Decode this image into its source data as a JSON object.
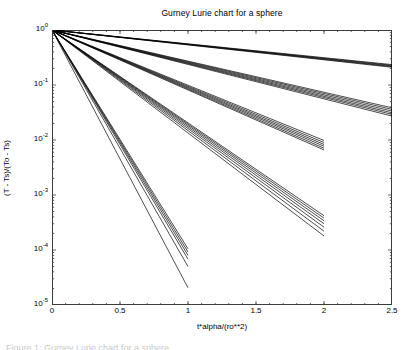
{
  "figure": {
    "title": "Gurney Lurie chart for a sphere",
    "xlabel": "t*alpha/(ro**2)",
    "ylabel": "(T - Ts)/(To - Ts)",
    "caption": "Figure 1: Gurney Lurie chart for a sphere"
  },
  "axes": {
    "x_ticks": [
      {
        "value": 0,
        "label": "0"
      },
      {
        "value": 0.5,
        "label": "0.5"
      },
      {
        "value": 1,
        "label": "1"
      },
      {
        "value": 1.5,
        "label": "1.5"
      },
      {
        "value": 2,
        "label": "2"
      },
      {
        "value": 2.5,
        "label": "2.5"
      }
    ],
    "y_ticks": [
      {
        "value": 0,
        "label": "10",
        "exponent": "0"
      },
      {
        "value": -1,
        "label": "10",
        "exponent": "-1"
      },
      {
        "value": -2,
        "label": "10",
        "exponent": "-2"
      },
      {
        "value": -3,
        "label": "10",
        "exponent": "-3"
      },
      {
        "value": -4,
        "label": "10",
        "exponent": "-4"
      },
      {
        "value": -5,
        "label": "10",
        "exponent": "-5"
      }
    ]
  },
  "chart_data": {
    "type": "line",
    "title": "Gurney Lurie chart for a sphere",
    "xlabel": "t*alpha/(ro**2)",
    "ylabel": "(T - Ts)/(To - Ts)",
    "xlim": [
      0,
      2.5
    ],
    "ylim": [
      1e-05,
      1
    ],
    "yscale": "log",
    "xscale": "linear",
    "grid": false,
    "legend": "none",
    "line_color": "#000000",
    "series": [
      {
        "name": "line-01",
        "x": [
          0,
          2.5
        ],
        "y": [
          1.0,
          0.235
        ]
      },
      {
        "name": "line-02",
        "x": [
          0,
          2.5
        ],
        "y": [
          1.0,
          0.228
        ]
      },
      {
        "name": "line-03",
        "x": [
          0,
          2.5
        ],
        "y": [
          1.0,
          0.222
        ]
      },
      {
        "name": "line-04",
        "x": [
          0,
          2.5
        ],
        "y": [
          1.0,
          0.216
        ]
      },
      {
        "name": "line-05",
        "x": [
          0,
          2.5
        ],
        "y": [
          1.0,
          0.21
        ]
      },
      {
        "name": "line-06",
        "x": [
          0,
          2.5
        ],
        "y": [
          1.0,
          0.0385
        ]
      },
      {
        "name": "line-07",
        "x": [
          0,
          2.5
        ],
        "y": [
          1.0,
          0.036
        ]
      },
      {
        "name": "line-08",
        "x": [
          0,
          2.5
        ],
        "y": [
          1.0,
          0.0335
        ]
      },
      {
        "name": "line-09",
        "x": [
          0,
          2.5
        ],
        "y": [
          1.0,
          0.0312
        ]
      },
      {
        "name": "line-10",
        "x": [
          0,
          2.5
        ],
        "y": [
          1.0,
          0.0292
        ]
      },
      {
        "name": "line-11",
        "x": [
          0,
          2.5
        ],
        "y": [
          1.0,
          0.0272
        ]
      },
      {
        "name": "line-12",
        "x": [
          0,
          2.0
        ],
        "y": [
          1.0,
          0.0098
        ]
      },
      {
        "name": "line-13",
        "x": [
          0,
          2.0
        ],
        "y": [
          1.0,
          0.009
        ]
      },
      {
        "name": "line-14",
        "x": [
          0,
          2.0
        ],
        "y": [
          1.0,
          0.0083
        ]
      },
      {
        "name": "line-15",
        "x": [
          0,
          2.0
        ],
        "y": [
          1.0,
          0.0077
        ]
      },
      {
        "name": "line-16",
        "x": [
          0,
          2.0
        ],
        "y": [
          1.0,
          0.0071
        ]
      },
      {
        "name": "line-17",
        "x": [
          0,
          2.0
        ],
        "y": [
          1.0,
          0.0066
        ]
      },
      {
        "name": "line-18",
        "x": [
          0,
          2.0
        ],
        "y": [
          1.0,
          0.00042
        ]
      },
      {
        "name": "line-19",
        "x": [
          0,
          2.0
        ],
        "y": [
          1.0,
          0.00038
        ]
      },
      {
        "name": "line-20",
        "x": [
          0,
          2.0
        ],
        "y": [
          1.0,
          0.00034
        ]
      },
      {
        "name": "line-21",
        "x": [
          0,
          2.0
        ],
        "y": [
          1.0,
          0.0003
        ]
      },
      {
        "name": "line-22",
        "x": [
          0,
          2.0
        ],
        "y": [
          1.0,
          0.00026
        ]
      },
      {
        "name": "line-23",
        "x": [
          0,
          2.0
        ],
        "y": [
          1.0,
          0.00022
        ]
      },
      {
        "name": "line-24",
        "x": [
          0,
          2.0
        ],
        "y": [
          1.0,
          0.00018
        ]
      },
      {
        "name": "line-25",
        "x": [
          0,
          1.0
        ],
        "y": [
          1.0,
          0.000105
        ]
      },
      {
        "name": "line-26",
        "x": [
          0,
          1.0
        ],
        "y": [
          1.0,
          9.2e-05
        ]
      },
      {
        "name": "line-27",
        "x": [
          0,
          1.0
        ],
        "y": [
          1.0,
          8e-05
        ]
      },
      {
        "name": "line-28",
        "x": [
          0,
          1.0
        ],
        "y": [
          1.0,
          6.8e-05
        ]
      },
      {
        "name": "line-29",
        "x": [
          0,
          1.0
        ],
        "y": [
          1.0,
          5e-05
        ]
      },
      {
        "name": "line-30",
        "x": [
          0,
          1.0
        ],
        "y": [
          1.0,
          2.05e-05
        ]
      }
    ]
  }
}
